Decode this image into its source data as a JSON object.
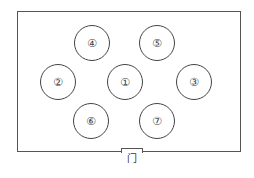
{
  "diagram": {
    "type": "floor-plan",
    "tables": [
      {
        "label": "①",
        "cx": 125,
        "cy": 82
      },
      {
        "label": "②",
        "cx": 58,
        "cy": 82
      },
      {
        "label": "③",
        "cx": 194,
        "cy": 82
      },
      {
        "label": "④",
        "cx": 92,
        "cy": 43
      },
      {
        "label": "⑤",
        "cx": 157,
        "cy": 43
      },
      {
        "label": "⑥",
        "cx": 91,
        "cy": 121
      },
      {
        "label": "⑦",
        "cx": 157,
        "cy": 121
      }
    ],
    "door": {
      "label": "门"
    }
  }
}
